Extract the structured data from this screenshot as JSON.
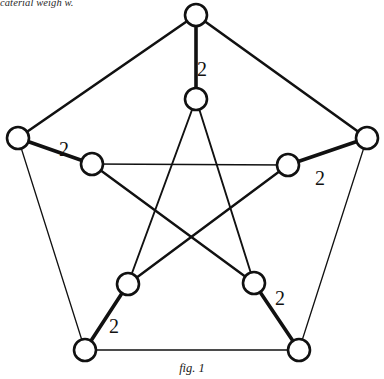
{
  "page": {
    "background_color": "#ffffff",
    "width": 384,
    "height": 379,
    "top_text_fragment": "caterial weigh w.",
    "caption": "fig. 1"
  },
  "figure": {
    "title": "fig. 1",
    "graph_name": "Petersen graph",
    "stroke_color": "#111111",
    "vertex_fill": "#ffffff",
    "vertex_radius": 11,
    "vertex_stroke_width": 2.6,
    "vertices": [
      {
        "id": "o-top",
        "name": "outer-top",
        "cx": 196,
        "cy": 15,
        "ring": "outer"
      },
      {
        "id": "o-right",
        "name": "outer-right",
        "cx": 367,
        "cy": 138,
        "ring": "outer"
      },
      {
        "id": "o-bottom-right",
        "name": "outer-bottom-right",
        "cx": 299,
        "cy": 350,
        "ring": "outer"
      },
      {
        "id": "o-bottom-left",
        "name": "outer-bottom-left",
        "cx": 85,
        "cy": 350,
        "ring": "outer"
      },
      {
        "id": "o-left",
        "name": "outer-left",
        "cx": 18,
        "cy": 138,
        "ring": "outer"
      },
      {
        "id": "i-top",
        "name": "inner-top",
        "cx": 196,
        "cy": 99,
        "ring": "inner"
      },
      {
        "id": "i-right",
        "name": "inner-right",
        "cx": 288,
        "cy": 165,
        "ring": "inner"
      },
      {
        "id": "i-bottom-right",
        "name": "inner-bottom-right",
        "cx": 254,
        "cy": 283,
        "ring": "inner"
      },
      {
        "id": "i-bottom-left",
        "name": "inner-bottom-left",
        "cx": 128,
        "cy": 284,
        "ring": "inner"
      },
      {
        "id": "i-left",
        "name": "inner-left",
        "cx": 92,
        "cy": 164,
        "ring": "inner"
      }
    ],
    "edges": [
      {
        "from": "o-top",
        "to": "o-right",
        "width": 2.6,
        "group": "outer-cycle"
      },
      {
        "from": "o-right",
        "to": "o-bottom-right",
        "width": 1.3,
        "group": "outer-cycle"
      },
      {
        "from": "o-bottom-right",
        "to": "o-bottom-left",
        "width": 1.3,
        "group": "outer-cycle"
      },
      {
        "from": "o-bottom-left",
        "to": "o-left",
        "width": 1.3,
        "group": "outer-cycle"
      },
      {
        "from": "o-left",
        "to": "o-top",
        "width": 2.6,
        "group": "outer-cycle"
      },
      {
        "from": "o-top",
        "to": "i-top",
        "width": 3.6,
        "group": "spoke",
        "label": "2"
      },
      {
        "from": "o-right",
        "to": "i-right",
        "width": 3.6,
        "group": "spoke",
        "label": "2"
      },
      {
        "from": "o-bottom-right",
        "to": "i-bottom-right",
        "width": 3.6,
        "group": "spoke",
        "label": "2"
      },
      {
        "from": "o-bottom-left",
        "to": "i-bottom-left",
        "width": 3.6,
        "group": "spoke",
        "label": "2"
      },
      {
        "from": "o-left",
        "to": "i-left",
        "width": 3.6,
        "group": "spoke",
        "label": "2"
      },
      {
        "from": "i-top",
        "to": "i-bottom-right",
        "width": 1.9,
        "group": "pentagram"
      },
      {
        "from": "i-bottom-right",
        "to": "i-left",
        "width": 2.4,
        "group": "pentagram"
      },
      {
        "from": "i-left",
        "to": "i-right",
        "width": 1.3,
        "group": "pentagram"
      },
      {
        "from": "i-right",
        "to": "i-bottom-left",
        "width": 2.4,
        "group": "pentagram"
      },
      {
        "from": "i-bottom-left",
        "to": "i-top",
        "width": 1.9,
        "group": "pentagram"
      }
    ],
    "edge_labels": [
      {
        "text": "2",
        "x": 202,
        "y": 76,
        "name": "weight-label-top"
      },
      {
        "text": "2",
        "x": 320,
        "y": 185,
        "name": "weight-label-right"
      },
      {
        "text": "2",
        "x": 280,
        "y": 305,
        "name": "weight-label-bottom-right"
      },
      {
        "text": "2",
        "x": 114,
        "y": 333,
        "name": "weight-label-bottom-left"
      },
      {
        "text": "2",
        "x": 64,
        "y": 156,
        "name": "weight-label-left"
      }
    ]
  }
}
